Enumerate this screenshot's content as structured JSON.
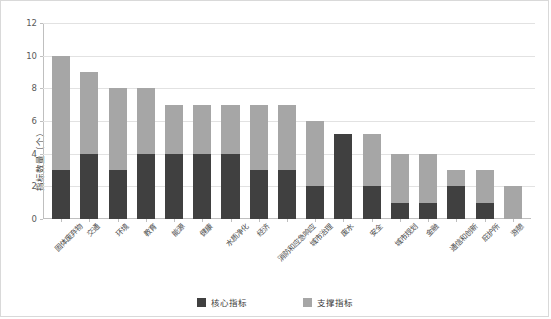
{
  "chart_data": {
    "type": "bar",
    "subtype": "stacked-bar",
    "title": "",
    "xlabel": "",
    "ylabel": "指标数量（个）",
    "ylim": [
      0,
      12
    ],
    "yticks": [
      0,
      2,
      4,
      6,
      8,
      10,
      12
    ],
    "grid": true,
    "legend_position": "bottom-center",
    "categories": [
      "固体废弃物",
      "交通",
      "环境",
      "教育",
      "能源",
      "健康",
      "水质净化",
      "经济",
      "消防和应急响应",
      "城市治理",
      "废水",
      "安全",
      "城市规划",
      "金融",
      "通信和创新",
      "庇护所",
      "游憩"
    ],
    "series": [
      {
        "name": "核心指标",
        "color": "#404040",
        "values": [
          3,
          4,
          3,
          4,
          4,
          4,
          4,
          3,
          3,
          2,
          5.2,
          2,
          1,
          1,
          2,
          1,
          0
        ]
      },
      {
        "name": "支撑指标",
        "color": "#a6a6a6",
        "values": [
          7,
          5,
          5,
          4,
          3,
          3,
          3,
          4,
          4,
          4,
          0,
          3.2,
          3,
          3,
          1,
          2,
          2
        ]
      }
    ],
    "totals": [
      10,
      9,
      8,
      8,
      7,
      7,
      7,
      7,
      7,
      6,
      5.2,
      5.2,
      4,
      4,
      3,
      3,
      2
    ]
  },
  "axis": {
    "y_title": "指标数量（个）",
    "tick_labels": [
      "12",
      "10",
      "8",
      "6",
      "4",
      "2",
      "0"
    ]
  },
  "legend": {
    "items": [
      {
        "label": "核心指标",
        "color": "#404040"
      },
      {
        "label": "支撑指标",
        "color": "#a6a6a6"
      }
    ]
  }
}
